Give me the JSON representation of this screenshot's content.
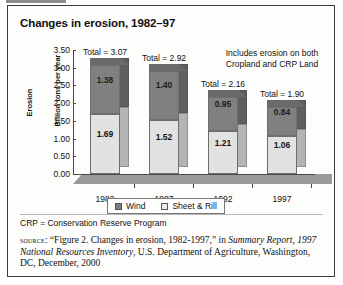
{
  "figure": {
    "title": "Changes in erosion, 1982–97",
    "annotation_line1": "Includes erosion on both",
    "annotation_line2": "Cropland and CRP Land",
    "crp_note": "CRP = Conservation Reserve Program",
    "source": {
      "label": "source",
      "separator": ": ",
      "quote": "“Figure 2. Changes in erosion, 1982-1997,”",
      "in_word": " in ",
      "italic_title": "Summary Report, 1997 National Resources Inventory",
      "tail": ", U.S. Department of Agriculture, Washington, DC, December, 2000"
    }
  },
  "legend": {
    "items": [
      {
        "label": "Wind",
        "color": "#7d7d7d"
      },
      {
        "label": "Sheet & Rill",
        "color": "#ededed"
      }
    ]
  },
  "chart_data": {
    "type": "bar",
    "subtype": "stacked",
    "title": "Changes in erosion, 1982–97",
    "xlabel": "",
    "ylabel": "Erosion Billion tons per year",
    "ylabel_line1": "Erosion",
    "ylabel_line2": "Billion tons per year",
    "ylim": [
      0.0,
      3.5
    ],
    "ytick_step": 0.5,
    "ytick_labels": [
      "3.50",
      "3.00",
      "2.50",
      "2.00",
      "1.50",
      "1.00",
      "0.50",
      "0.00"
    ],
    "ytick_values": [
      3.5,
      3.0,
      2.5,
      2.0,
      1.5,
      1.0,
      0.5,
      0.0
    ],
    "grid": false,
    "legend_position": "bottom-center",
    "categories": [
      "1982",
      "1987",
      "1992",
      "1997"
    ],
    "series": [
      {
        "name": "Sheet & Rill",
        "color": "#e2e2e2",
        "values": [
          1.69,
          1.52,
          1.21,
          1.06
        ]
      },
      {
        "name": "Wind",
        "color": "#808080",
        "values": [
          1.38,
          1.4,
          0.95,
          0.84
        ]
      }
    ],
    "totals": [
      3.07,
      2.92,
      2.16,
      1.9
    ],
    "total_labels": [
      "Total = 3.07",
      "Total = 2.92",
      "Total = 2.16",
      "Total = 1.90"
    ],
    "bar_labels": {
      "sheet_rill": [
        "1.69",
        "1.52",
        "1.21",
        "1.06"
      ],
      "wind": [
        "1.38",
        "1.40",
        "0.95",
        "0.84"
      ]
    },
    "annotation": "Includes erosion on both Cropland and CRP Land"
  }
}
